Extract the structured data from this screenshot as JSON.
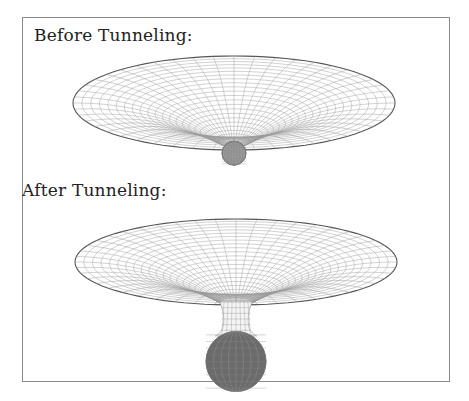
{
  "panels": [
    {
      "label": "Before Tunneling:",
      "state": "before",
      "bulb": "small"
    },
    {
      "label": "After Tunneling:",
      "state": "after",
      "bulb": "large"
    }
  ],
  "colors": {
    "frame": "#8a8a8a",
    "mesh": "#9a9a9a",
    "rim": "#555555",
    "bulb": "#6b6b6b"
  }
}
